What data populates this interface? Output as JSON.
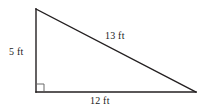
{
  "figure": {
    "type": "right-triangle-diagram",
    "background_color": "#ffffff",
    "stroke_color": "#231f20",
    "text_color": "#1a1a1a",
    "labels": {
      "vertical_leg": "5 ft",
      "hypotenuse": "13 ft",
      "horizontal_leg": "12 ft"
    },
    "geometry": {
      "apex": {
        "x": 36,
        "y": 9
      },
      "right_angle_vertex": {
        "x": 36,
        "y": 92
      },
      "right_vertex": {
        "x": 196,
        "y": 92
      },
      "right_angle_marker_size": 7
    },
    "measurements": {
      "vertical_leg_value": 5,
      "horizontal_leg_value": 12,
      "hypotenuse_value": 13,
      "units": "ft"
    }
  }
}
